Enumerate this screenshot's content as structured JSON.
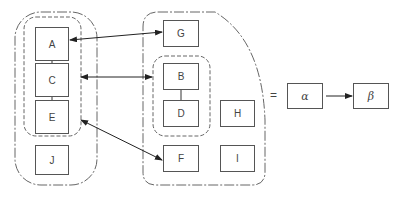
{
  "diagram": {
    "left_group": {
      "nodes": [
        {
          "id": "A",
          "label": "A"
        },
        {
          "id": "C",
          "label": "C"
        },
        {
          "id": "E",
          "label": "E"
        },
        {
          "id": "J",
          "label": "J"
        }
      ],
      "inner_group": [
        "A",
        "C",
        "E"
      ]
    },
    "right_group": {
      "nodes": [
        {
          "id": "G",
          "label": "G"
        },
        {
          "id": "B",
          "label": "B"
        },
        {
          "id": "D",
          "label": "D"
        },
        {
          "id": "H",
          "label": "H"
        },
        {
          "id": "F",
          "label": "F"
        },
        {
          "id": "I",
          "label": "I"
        }
      ],
      "inner_group": [
        "B",
        "D"
      ]
    },
    "edges": [
      {
        "from": "A",
        "to": "C",
        "type": "line"
      },
      {
        "from": "C",
        "to": "E",
        "type": "line"
      },
      {
        "from": "B",
        "to": "D",
        "type": "line"
      },
      {
        "from": "A",
        "to": "G",
        "type": "bidirectional-arrow"
      },
      {
        "from": "left-inner-group",
        "to": "right-inner-group",
        "type": "bidirectional-arrow"
      },
      {
        "from": "left-inner-group",
        "to": "F",
        "type": "bidirectional-arrow"
      }
    ],
    "legend": {
      "equals": "=",
      "alpha": "α",
      "beta": "β"
    }
  }
}
